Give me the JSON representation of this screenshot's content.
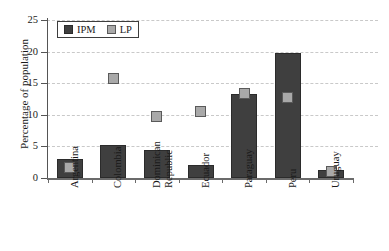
{
  "chart_data": {
    "type": "bar",
    "title": "",
    "subtitle": "",
    "xlabel": "",
    "ylabel": "Percentage of population",
    "ylim": [
      0,
      25
    ],
    "yticks": [
      0,
      5,
      10,
      15,
      20,
      25
    ],
    "ytick_labels": [
      "0",
      "5",
      "10",
      "15",
      "20",
      "25"
    ],
    "grid": true,
    "grid_axis": "y",
    "grid_style": "dashed",
    "legend_position": "top-left",
    "categories": [
      "Argentina",
      "Colombia",
      "Dominican\nRepublic",
      "Ecuador",
      "Paraguay",
      "Peru",
      "Uruguay"
    ],
    "series": [
      {
        "name": "IPM",
        "type": "bar",
        "color": "#3f3f3f",
        "values": [
          3.0,
          5.3,
          4.5,
          2.1,
          13.3,
          19.8,
          1.3
        ]
      },
      {
        "name": "LP",
        "type": "scatter",
        "marker": "square",
        "color": "#a9a9a9",
        "values": [
          1.7,
          15.8,
          9.8,
          10.5,
          13.3,
          12.7,
          1.1
        ]
      }
    ]
  },
  "legend": {
    "entries": [
      {
        "label": "IPM",
        "swatch": "dark-square-swatch"
      },
      {
        "label": "LP",
        "swatch": "light-square-swatch"
      }
    ]
  },
  "axes": {
    "y_title": "Percentage of population"
  },
  "colors": {
    "ipm": "#3f3f3f",
    "lp": "#a9a9a9",
    "grid": "#c9c9c9",
    "axis": "#555555",
    "text": "#1a1a1a",
    "background": "#ffffff"
  }
}
